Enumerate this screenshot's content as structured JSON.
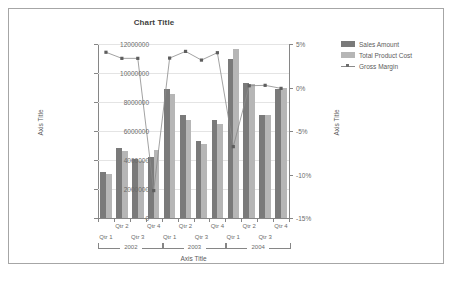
{
  "chart_data": {
    "type": "bar",
    "title": "Chart Title",
    "xlabel": "Axis Title",
    "ylabel": "Axis Title",
    "ylabel_secondary": "Axis Title",
    "grid": true,
    "legend_position": "right",
    "ylim": [
      0,
      12000000
    ],
    "ylim_secondary": [
      -0.15,
      0.05
    ],
    "yticks": [
      "0",
      "2000000",
      "4000000",
      "6000000",
      "8000000",
      "10000000",
      "12000000"
    ],
    "ytick_values": [
      0,
      2000000,
      4000000,
      6000000,
      8000000,
      10000000,
      12000000
    ],
    "yticks_secondary": [
      "-15%",
      "-10%",
      "-5%",
      "0%",
      "5%"
    ],
    "ytick_values_secondary": [
      -0.15,
      -0.1,
      -0.05,
      0.0,
      0.05
    ],
    "categories": [
      "Qtr 1",
      "Qtr 2",
      "Qtr 3",
      "Qtr 4",
      "Qtr 1",
      "Qtr 2",
      "Qtr 3",
      "Qtr 4",
      "Qtr 1",
      "Qtr 2",
      "Qtr 3",
      "Qtr 4"
    ],
    "group_labels": [
      "2002",
      "2003",
      "2004"
    ],
    "group_spans": [
      4,
      4,
      4
    ],
    "series": [
      {
        "name": "Sales Amount",
        "type": "bar",
        "axis": "left",
        "color": "#7a7a7a",
        "values": [
          3200000,
          4850000,
          4050000,
          4180000,
          8900000,
          7080000,
          5300000,
          6750000,
          10950000,
          9330000,
          7130000,
          8900000
        ]
      },
      {
        "name": "Total Product Cost",
        "type": "bar",
        "axis": "left",
        "color": "#b6b6b6",
        "values": [
          3060000,
          4650000,
          3900000,
          4660000,
          8550000,
          6750000,
          5130000,
          6500000,
          11650000,
          9260000,
          7130000,
          9000000
        ]
      },
      {
        "name": "Gross Margin",
        "type": "line",
        "axis": "right",
        "color": "#8a8a8a",
        "values": [
          0.0405,
          0.0335,
          0.0335,
          -0.1185,
          0.0338,
          0.0415,
          0.0315,
          0.04,
          -0.068,
          0.002,
          0.0025,
          -0.001
        ]
      }
    ]
  },
  "legend": {
    "items": [
      {
        "label": "Sales Amount",
        "marker": "square-swatch-dark"
      },
      {
        "label": "Total Product Cost",
        "marker": "square-swatch-light"
      },
      {
        "label": "Gross Margin",
        "marker": "line-with-marker"
      }
    ]
  },
  "bottom_artifact": {
    "text": ""
  }
}
